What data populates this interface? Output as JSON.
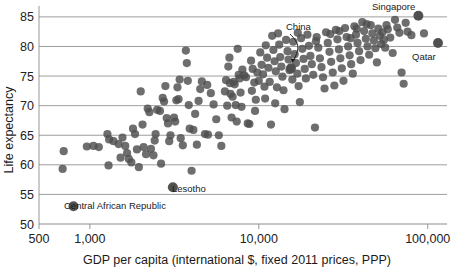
{
  "chart_data": {
    "type": "scatter",
    "title": "",
    "xlabel": "GDP per capita (international $, fixed 2011 prices, PPP)",
    "ylabel": "Life expectancy",
    "xscale": "log",
    "xlim": [
      500,
      130000
    ],
    "ylim": [
      50,
      86.5
    ],
    "xticks": [
      500,
      1000,
      10000,
      100000
    ],
    "xticklabels": [
      "500",
      "1,000",
      "10,000",
      "100,000"
    ],
    "yticks": [
      50,
      55,
      60,
      65,
      70,
      75,
      80,
      85
    ],
    "yticklabels": [
      "50",
      "55",
      "60",
      "65",
      "70",
      "75",
      "80",
      "85"
    ],
    "grid": "horizontal",
    "legend": "none",
    "marker": {
      "color": "#4e4e4e",
      "opacity": 0.82,
      "radius": 4.1
    },
    "annotations": [
      {
        "label": "Singapore",
        "x": 88000,
        "y": 85.2,
        "tx": 372,
        "ty": 10,
        "arrow": false
      },
      {
        "label": "Qatar",
        "x": 115000,
        "y": 80.6,
        "tx": 412,
        "ty": 60,
        "arrow": false
      },
      {
        "label": "China",
        "x": 15500,
        "y": 76.3,
        "tx": 286,
        "ty": 30,
        "arrow": true
      },
      {
        "label": "Lesotho",
        "x": 3100,
        "y": 56.2,
        "tx": 172,
        "ty": 192,
        "arrow": false
      },
      {
        "label": "Central African Republic",
        "x": 800,
        "y": 53.0,
        "tx": 64,
        "ty": 209,
        "arrow": false
      }
    ],
    "points": [
      [
        700,
        62.3
      ],
      [
        690,
        59.3
      ],
      [
        960,
        63.1
      ],
      [
        1050,
        63.2
      ],
      [
        1270,
        65.2
      ],
      [
        1300,
        64.3
      ],
      [
        1290,
        59.9
      ],
      [
        1480,
        63.5
      ],
      [
        1520,
        61.2
      ],
      [
        1560,
        64.6
      ],
      [
        1620,
        63.2
      ],
      [
        1700,
        61.0
      ],
      [
        1760,
        60.4
      ],
      [
        1800,
        66.1
      ],
      [
        1850,
        65.2
      ],
      [
        1900,
        62.6
      ],
      [
        1950,
        59.6
      ],
      [
        2000,
        72.4
      ],
      [
        2050,
        66.8
      ],
      [
        2080,
        63.0
      ],
      [
        2150,
        61.8
      ],
      [
        2200,
        69.5
      ],
      [
        2250,
        68.9
      ],
      [
        2300,
        62.7
      ],
      [
        2380,
        61.6
      ],
      [
        2450,
        65.2
      ],
      [
        2500,
        69.3
      ],
      [
        2600,
        69.1
      ],
      [
        2700,
        71.3
      ],
      [
        2750,
        70.7
      ],
      [
        2800,
        73.3
      ],
      [
        2850,
        67.9
      ],
      [
        2900,
        67.0
      ],
      [
        2950,
        64.0
      ],
      [
        3000,
        65.0
      ],
      [
        3100,
        56.2
      ],
      [
        3150,
        68.0
      ],
      [
        3200,
        67.3
      ],
      [
        3250,
        70.9
      ],
      [
        3300,
        73.1
      ],
      [
        3400,
        74.4
      ],
      [
        3450,
        64.5
      ],
      [
        3550,
        63.3
      ],
      [
        3700,
        79.3
      ],
      [
        3750,
        77.2
      ],
      [
        3800,
        74.2
      ],
      [
        3900,
        66.1
      ],
      [
        4000,
        59.0
      ],
      [
        4100,
        65.9
      ],
      [
        4200,
        68.6
      ],
      [
        4300,
        63.4
      ],
      [
        4400,
        70.8
      ],
      [
        4600,
        74.1
      ],
      [
        4800,
        65.2
      ],
      [
        5000,
        65.1
      ],
      [
        6300,
        72.4
      ],
      [
        6400,
        74.3
      ],
      [
        6500,
        70.0
      ],
      [
        6600,
        76.6
      ],
      [
        6700,
        78.1
      ],
      [
        6750,
        73.8
      ],
      [
        6800,
        72.0
      ],
      [
        6900,
        68.0
      ],
      [
        7000,
        71.5
      ],
      [
        7100,
        74.0
      ],
      [
        7200,
        73.6
      ],
      [
        7300,
        70.1
      ],
      [
        7400,
        67.3
      ],
      [
        7500,
        79.6
      ],
      [
        7600,
        75.2
      ],
      [
        7700,
        74.6
      ],
      [
        7800,
        72.2
      ],
      [
        7900,
        69.8
      ],
      [
        8000,
        76.1
      ],
      [
        8200,
        75.1
      ],
      [
        8400,
        74.8
      ],
      [
        8600,
        67.0
      ],
      [
        8800,
        66.9
      ],
      [
        9000,
        77.6
      ],
      [
        9200,
        76.2
      ],
      [
        9400,
        73.9
      ],
      [
        9600,
        71.0
      ],
      [
        9800,
        75.6
      ],
      [
        10000,
        74.2
      ],
      [
        10200,
        79.0
      ],
      [
        10400,
        76.9
      ],
      [
        10600,
        75.3
      ],
      [
        10800,
        73.2
      ],
      [
        11000,
        80.2
      ],
      [
        11200,
        78.1
      ],
      [
        11400,
        76.4
      ],
      [
        11600,
        74.0
      ],
      [
        11800,
        66.8
      ],
      [
        12000,
        81.8
      ],
      [
        12200,
        79.4
      ],
      [
        12400,
        77.5
      ],
      [
        12600,
        75.8
      ],
      [
        12800,
        73.1
      ],
      [
        13000,
        82.2
      ],
      [
        13200,
        80.3
      ],
      [
        13400,
        78.2
      ],
      [
        13600,
        76.6
      ],
      [
        13800,
        74.9
      ],
      [
        14000,
        72.6
      ],
      [
        14200,
        69.4
      ],
      [
        14500,
        81.1
      ],
      [
        14800,
        79.2
      ],
      [
        15000,
        77.8
      ],
      [
        15200,
        76.0
      ],
      [
        15500,
        76.3
      ],
      [
        15800,
        74.4
      ],
      [
        16000,
        80.8
      ],
      [
        16300,
        78.7
      ],
      [
        16600,
        77.2
      ],
      [
        16900,
        75.4
      ],
      [
        17200,
        73.3
      ],
      [
        17500,
        70.6
      ],
      [
        17800,
        81.4
      ],
      [
        18100,
        79.6
      ],
      [
        18400,
        77.9
      ],
      [
        18700,
        76.2
      ],
      [
        19000,
        74.6
      ],
      [
        19400,
        82.0
      ],
      [
        19800,
        80.1
      ],
      [
        20200,
        78.4
      ],
      [
        20600,
        77.0
      ],
      [
        21000,
        75.2
      ],
      [
        21500,
        66.3
      ],
      [
        22000,
        81.6
      ],
      [
        22500,
        79.8
      ],
      [
        23000,
        78.0
      ],
      [
        23500,
        76.5
      ],
      [
        24000,
        74.8
      ],
      [
        24500,
        72.9
      ],
      [
        25000,
        82.4
      ],
      [
        25600,
        80.6
      ],
      [
        26200,
        79.1
      ],
      [
        26800,
        77.4
      ],
      [
        27400,
        75.6
      ],
      [
        28000,
        73.4
      ],
      [
        28600,
        82.8
      ],
      [
        29200,
        81.2
      ],
      [
        29800,
        79.5
      ],
      [
        30400,
        78.0
      ],
      [
        31000,
        76.3
      ],
      [
        31700,
        74.2
      ],
      [
        32400,
        83.1
      ],
      [
        33100,
        81.6
      ],
      [
        33800,
        80.0
      ],
      [
        34500,
        78.5
      ],
      [
        35200,
        77.0
      ],
      [
        36000,
        75.4
      ],
      [
        36800,
        83.4
      ],
      [
        37600,
        82.0
      ],
      [
        38400,
        80.6
      ],
      [
        39200,
        79.2
      ],
      [
        40000,
        77.7
      ],
      [
        41000,
        84.1
      ],
      [
        42000,
        82.6
      ],
      [
        43000,
        81.3
      ],
      [
        44000,
        80.0
      ],
      [
        45000,
        78.6
      ],
      [
        46000,
        83.6
      ],
      [
        47000,
        82.2
      ],
      [
        48000,
        81.0
      ],
      [
        49000,
        79.7
      ],
      [
        50000,
        77.3
      ],
      [
        51000,
        83.0
      ],
      [
        52000,
        81.8
      ],
      [
        53000,
        80.4
      ],
      [
        54000,
        82.4
      ],
      [
        55000,
        81.1
      ],
      [
        56000,
        79.8
      ],
      [
        58000,
        82.9
      ],
      [
        60000,
        81.5
      ],
      [
        62000,
        78.9
      ],
      [
        64000,
        84.5
      ],
      [
        66000,
        83.2
      ],
      [
        68000,
        82.3
      ],
      [
        70000,
        75.6
      ],
      [
        72000,
        73.7
      ],
      [
        74000,
        84.0
      ],
      [
        76000,
        82.5
      ],
      [
        80000,
        81.9
      ],
      [
        88000,
        85.2
      ],
      [
        95000,
        82.2
      ],
      [
        115000,
        80.6
      ],
      [
        800,
        53.0
      ],
      [
        5200,
        72.1
      ],
      [
        5400,
        70.2
      ],
      [
        5600,
        67.7
      ],
      [
        5800,
        65.0
      ],
      [
        6000,
        63.2
      ],
      [
        2420,
        64.1
      ],
      [
        2640,
        60.2
      ],
      [
        1380,
        64.0
      ],
      [
        1130,
        63.0
      ],
      [
        1660,
        62.0
      ],
      [
        3350,
        71.1
      ],
      [
        3850,
        70.1
      ],
      [
        4500,
        72.8
      ],
      [
        4950,
        73.5
      ],
      [
        9100,
        72.5
      ],
      [
        9500,
        69.1
      ],
      [
        10900,
        71.2
      ],
      [
        12500,
        70.4
      ],
      [
        17000,
        82.3
      ],
      [
        21800,
        80.9
      ],
      [
        26500,
        82.1
      ],
      [
        30000,
        82.6
      ],
      [
        35000,
        81.4
      ],
      [
        38000,
        83.0
      ],
      [
        43500,
        83.8
      ],
      [
        57000,
        83.6
      ]
    ]
  }
}
